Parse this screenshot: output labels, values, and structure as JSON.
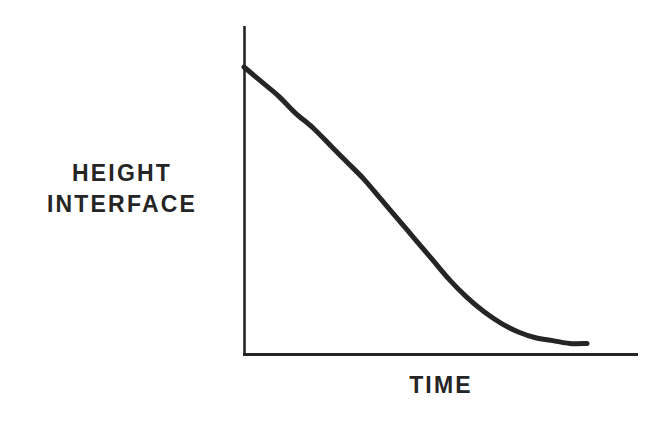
{
  "figure": {
    "background_color": "#ffffff",
    "ink_color": "#252525",
    "width": 667,
    "height": 427
  },
  "labels": {
    "y_axis_line1": "HEIGHT",
    "y_axis_line2": "INTERFACE",
    "x_axis": "TIME"
  },
  "chart_data": {
    "type": "line",
    "title": "",
    "subtitle": "",
    "xlabel": "TIME",
    "ylabel": "HEIGHT INTERFACE",
    "grid": false,
    "legend": "none",
    "axis_tick_labels": {
      "x": [],
      "y": []
    },
    "xlim": [
      0,
      1
    ],
    "ylim": [
      0,
      1
    ],
    "annotations": [],
    "series": [
      {
        "name": "interface height decay",
        "color": "#252525",
        "line_width": 5,
        "x": [
          0.0,
          0.05,
          0.1,
          0.15,
          0.2,
          0.25,
          0.3,
          0.35,
          0.4,
          0.45,
          0.5,
          0.55,
          0.6,
          0.65,
          0.7,
          0.75,
          0.8,
          0.85,
          0.9,
          0.95,
          1.0
        ],
        "y": [
          1.0,
          0.95,
          0.9,
          0.84,
          0.79,
          0.73,
          0.67,
          0.61,
          0.54,
          0.47,
          0.4,
          0.33,
          0.26,
          0.2,
          0.15,
          0.11,
          0.08,
          0.06,
          0.05,
          0.04,
          0.04
        ]
      }
    ],
    "pixel_geometry": {
      "y_axis_x": 244,
      "y_axis_top": 26,
      "x_axis_y": 355,
      "x_axis_right": 638,
      "curve_start": [
        244,
        67
      ],
      "curve_end": [
        587,
        338
      ]
    }
  }
}
